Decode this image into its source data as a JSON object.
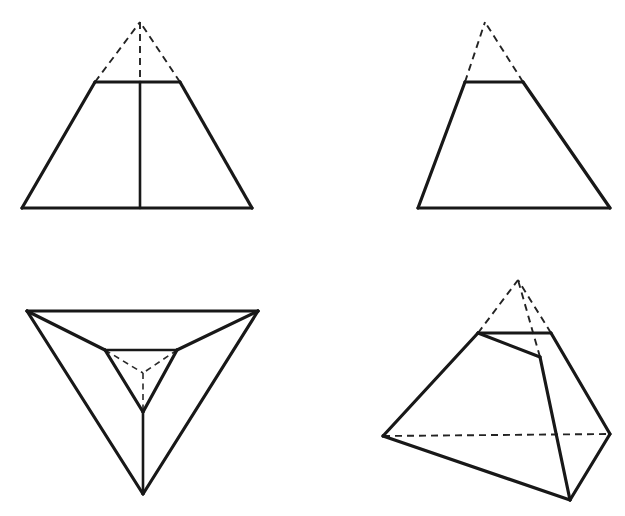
{
  "document": {
    "title": "Truncated Pyramid — Orthographic and Pictorial Views",
    "background_color": "#ffffff",
    "line_color": "#181818",
    "hidden_line_color": "#232323",
    "width": 625,
    "height": 516
  },
  "figures": [
    {
      "id": "front-view-symmetric",
      "name": "Front View of Frustum with Axis",
      "position": "top-left",
      "description": "Symmetric trapezoid with dashed apex completion and vertical center axis",
      "geometry": {
        "apex": [
          140,
          22
        ],
        "base_left": [
          22,
          208
        ],
        "base_right": [
          252,
          208
        ],
        "cut_left": [
          95,
          82
        ],
        "cut_right": [
          180,
          82
        ],
        "axis_top": [
          140,
          82
        ],
        "axis_bottom": [
          140,
          208
        ]
      },
      "solid_edges": [
        [
          [
            95,
            82
          ],
          [
            22,
            208
          ]
        ],
        [
          [
            180,
            82
          ],
          [
            252,
            208
          ]
        ],
        [
          [
            22,
            208
          ],
          [
            252,
            208
          ]
        ],
        [
          [
            95,
            82
          ],
          [
            180,
            82
          ]
        ],
        [
          [
            140,
            82
          ],
          [
            140,
            208
          ]
        ]
      ],
      "hidden_edges": [
        [
          [
            95,
            82
          ],
          [
            140,
            22
          ]
        ],
        [
          [
            180,
            82
          ],
          [
            140,
            22
          ]
        ],
        [
          [
            140,
            22
          ],
          [
            140,
            82
          ]
        ]
      ]
    },
    {
      "id": "front-view-offset",
      "name": "Front View of Oblique Frustum",
      "position": "top-right",
      "description": "Asymmetric trapezoid with dashed apex completion, no center axis",
      "geometry": {
        "apex": [
          485,
          22
        ],
        "base_left": [
          418,
          208
        ],
        "base_right": [
          610,
          208
        ],
        "cut_left": [
          465,
          82
        ],
        "cut_right": [
          523,
          82
        ]
      },
      "solid_edges": [
        [
          [
            465,
            82
          ],
          [
            418,
            208
          ]
        ],
        [
          [
            523,
            82
          ],
          [
            610,
            208
          ]
        ],
        [
          [
            418,
            208
          ],
          [
            610,
            208
          ]
        ],
        [
          [
            465,
            82
          ],
          [
            523,
            82
          ]
        ]
      ],
      "hidden_edges": [
        [
          [
            465,
            82
          ],
          [
            485,
            22
          ]
        ],
        [
          [
            523,
            82
          ],
          [
            485,
            22
          ]
        ]
      ]
    },
    {
      "id": "top-view-triangular",
      "name": "Top View of Triangular Frustum",
      "position": "bottom-left",
      "description": "Inverted outer triangle with concentric inverted inner triangle, radial edges, and dashed center lines",
      "geometry": {
        "outer_top_left": [
          27,
          311
        ],
        "outer_top_right": [
          258,
          311
        ],
        "outer_bottom": [
          143,
          494
        ],
        "inner_top_left": [
          105,
          350
        ],
        "inner_top_right": [
          177,
          350
        ],
        "inner_bottom": [
          143,
          412
        ],
        "center": [
          143,
          373
        ]
      },
      "solid_edges": [
        [
          [
            27,
            311
          ],
          [
            258,
            311
          ]
        ],
        [
          [
            27,
            311
          ],
          [
            143,
            494
          ]
        ],
        [
          [
            258,
            311
          ],
          [
            143,
            494
          ]
        ],
        [
          [
            105,
            350
          ],
          [
            177,
            350
          ]
        ],
        [
          [
            105,
            350
          ],
          [
            143,
            412
          ]
        ],
        [
          [
            177,
            350
          ],
          [
            143,
            412
          ]
        ],
        [
          [
            27,
            311
          ],
          [
            105,
            350
          ]
        ],
        [
          [
            258,
            311
          ],
          [
            177,
            350
          ]
        ],
        [
          [
            143,
            412
          ],
          [
            143,
            494
          ]
        ]
      ],
      "hidden_edges": [
        [
          [
            105,
            350
          ],
          [
            143,
            373
          ]
        ],
        [
          [
            177,
            350
          ],
          [
            143,
            373
          ]
        ],
        [
          [
            143,
            373
          ],
          [
            143,
            412
          ]
        ]
      ]
    },
    {
      "id": "pictorial-view",
      "name": "Pictorial View of Truncated Triangular Pyramid",
      "position": "bottom-right",
      "description": "Three-dimensional pictorial of a truncated triangular pyramid with dashed apex and hidden base edge",
      "geometry": {
        "apex": [
          518,
          280
        ],
        "top_back_left": [
          478,
          333
        ],
        "top_back_right": [
          551,
          333
        ],
        "top_front": [
          540,
          357
        ],
        "base_left": [
          383,
          436
        ],
        "base_right": [
          610,
          434
        ],
        "base_front": [
          570,
          500
        ]
      },
      "solid_edges": [
        [
          [
            478,
            333
          ],
          [
            551,
            333
          ]
        ],
        [
          [
            478,
            333
          ],
          [
            540,
            357
          ]
        ],
        [
          [
            478,
            333
          ],
          [
            383,
            436
          ]
        ],
        [
          [
            551,
            333
          ],
          [
            610,
            434
          ]
        ],
        [
          [
            540,
            357
          ],
          [
            570,
            500
          ]
        ],
        [
          [
            383,
            436
          ],
          [
            570,
            500
          ]
        ],
        [
          [
            610,
            434
          ],
          [
            570,
            500
          ]
        ]
      ],
      "hidden_edges": [
        [
          [
            478,
            333
          ],
          [
            518,
            280
          ]
        ],
        [
          [
            551,
            333
          ],
          [
            518,
            280
          ]
        ],
        [
          [
            540,
            357
          ],
          [
            518,
            280
          ]
        ],
        [
          [
            383,
            436
          ],
          [
            610,
            434
          ]
        ]
      ]
    }
  ]
}
